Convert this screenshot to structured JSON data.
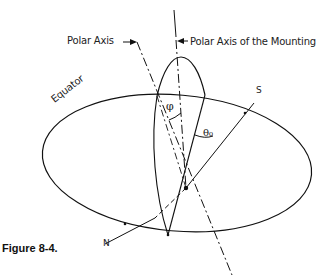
{
  "figure": {
    "caption": "Figure 8-4.",
    "labels": {
      "polar_axis": "Polar Axis",
      "polar_axis_mounting": "Polar Axis of the Mounting",
      "equator": "Equator",
      "south": "S",
      "north": "N",
      "phi": "φ",
      "theta0": "θ₀"
    },
    "colors": {
      "line": "#111111",
      "background": "#ffffff"
    }
  }
}
